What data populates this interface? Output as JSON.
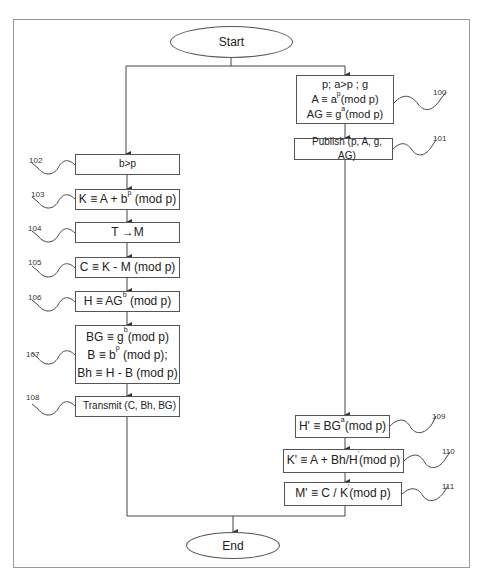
{
  "start": {
    "label": "Start"
  },
  "end": {
    "label": "End"
  },
  "right_column": [
    {
      "ref": "100",
      "lines": [
        {
          "pre": "p; a>p ; g",
          "sup": "",
          "post": ""
        },
        {
          "pre": "A ≡ a",
          "sup": "p",
          "post": "(mod p)"
        },
        {
          "pre": "AG ≡ g",
          "sup": "a",
          "post": "(mod p)"
        }
      ]
    },
    {
      "ref": "101",
      "lines": [
        {
          "pre": "Publish (p, A, g, AG)",
          "sup": "",
          "post": ""
        }
      ]
    },
    {
      "ref": "109",
      "lines": [
        {
          "pre": "H' ≡ BG",
          "sup": "a",
          "post": "(mod p)"
        }
      ]
    },
    {
      "ref": "110",
      "lines": [
        {
          "pre": "K' ≡ A + Bh/H",
          "sup": "'",
          "post": "(mod p)"
        }
      ]
    },
    {
      "ref": "111",
      "lines": [
        {
          "pre": "M' ≡ C / K",
          "sup": "'",
          "post": "(mod p)"
        }
      ]
    }
  ],
  "left_column": [
    {
      "ref": "102",
      "lines": [
        {
          "pre": "b>p",
          "sup": "",
          "post": ""
        }
      ]
    },
    {
      "ref": "103",
      "lines": [
        {
          "pre": "K ≡ A + b",
          "sup": "p",
          "post": " (mod p)"
        }
      ]
    },
    {
      "ref": "104",
      "lines": [
        {
          "pre": "T →M",
          "sup": "",
          "post": ""
        }
      ]
    },
    {
      "ref": "105",
      "lines": [
        {
          "pre": "C ≡ K - M (mod p)",
          "sup": "",
          "post": ""
        }
      ]
    },
    {
      "ref": "106",
      "lines": [
        {
          "pre": "H ≡ AG",
          "sup": "b",
          "post": " (mod p)"
        }
      ]
    },
    {
      "ref": "107",
      "lines": [
        {
          "pre": "BG ≡ g",
          "sup": "b",
          "post": "(mod p)"
        },
        {
          "pre": "B ≡ b",
          "sup": "p",
          "post": " (mod p);"
        },
        {
          "pre": "Bh ≡ H - B (mod p)",
          "sup": "",
          "post": ""
        }
      ]
    },
    {
      "ref": "108",
      "lines": [
        {
          "pre": "Transmit (C, Bh, BG)",
          "sup": "",
          "post": ""
        }
      ]
    }
  ]
}
